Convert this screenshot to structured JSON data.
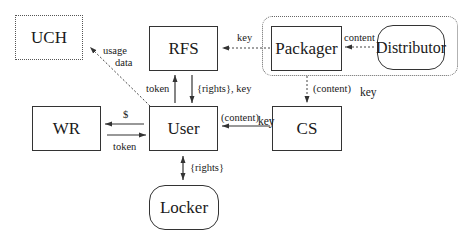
{
  "nodes": {
    "uch": {
      "label": "UCH"
    },
    "rfs": {
      "label": "RFS"
    },
    "packager": {
      "label": "Packager"
    },
    "distributor": {
      "label": "Distributor"
    },
    "wr": {
      "label": "WR"
    },
    "user": {
      "label": "User"
    },
    "cs": {
      "label": "CS"
    },
    "locker": {
      "label": "Locker"
    }
  },
  "edges": {
    "user_to_uch": {
      "label_line1": "usage",
      "label_line2": "data",
      "style": "dashed"
    },
    "packager_to_rfs": {
      "label": "key",
      "style": "dashed"
    },
    "distributor_to_packager": {
      "label": "content",
      "style": "dashed"
    },
    "user_to_rfs": {
      "label": "token"
    },
    "rfs_to_user": {
      "label": "{rights}, key"
    },
    "packager_to_cs": {
      "label_paren": "(content)",
      "label_key": "key",
      "style": "dashed"
    },
    "cs_to_user": {
      "label_paren": "(content)",
      "label_key": "key"
    },
    "user_to_wr": {
      "label": "$"
    },
    "wr_to_user": {
      "label": "token"
    },
    "user_locker": {
      "label": "{rights}"
    }
  }
}
